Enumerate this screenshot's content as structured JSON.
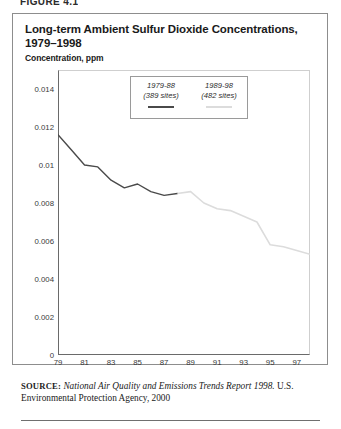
{
  "figure": {
    "caption_partial": "FIGURE 4.1",
    "title": "Long-term Ambient Sulfur Dioxide Concentrations, 1979–1998",
    "subtitle": "Concentration, ppm"
  },
  "legend": {
    "entries": [
      {
        "name": "1979-88",
        "sites": "(389 sites)",
        "color": "#4a4a4a"
      },
      {
        "name": "1989-98",
        "sites": "(482 sites)",
        "color": "#dcdcdc"
      }
    ]
  },
  "source": {
    "label": "SOURCE:",
    "italic_part": "National Air Quality and Emissions Trends Report 1998.",
    "rest": " U.S. Environmental Protection Agency, 2000"
  },
  "chart_data": {
    "type": "line",
    "title": "Long-term Ambient Sulfur Dioxide Concentrations, 1979–1998",
    "xlabel": "",
    "ylabel": "Concentration, ppm",
    "xlim": [
      1979,
      1998
    ],
    "ylim": [
      0,
      0.015
    ],
    "grid": false,
    "legend_position": "inside-top-center",
    "y_ticks": [
      0,
      0.002,
      0.004,
      0.006,
      0.008,
      0.01,
      0.012,
      0.014
    ],
    "y_tick_labels": [
      "0",
      "0.002",
      "0.004",
      "0.006",
      "0.008",
      "0.01",
      "0.012",
      "0.014"
    ],
    "x_ticks": [
      1979,
      1981,
      1983,
      1985,
      1987,
      1989,
      1991,
      1993,
      1995,
      1997
    ],
    "x_tick_labels": [
      "79",
      "81",
      "83",
      "85",
      "87",
      "89",
      "91",
      "93",
      "95",
      "97"
    ],
    "series": [
      {
        "name": "1979-88",
        "sites": 389,
        "color": "#4a4a4a",
        "x": [
          1979,
          1980,
          1981,
          1982,
          1983,
          1984,
          1985,
          1986,
          1987,
          1988
        ],
        "values": [
          0.0116,
          0.0108,
          0.01,
          0.0099,
          0.0092,
          0.0088,
          0.009,
          0.0086,
          0.0084,
          0.0085
        ]
      },
      {
        "name": "1989-98",
        "sites": 482,
        "color": "#dcdcdc",
        "x": [
          1989,
          1990,
          1991,
          1992,
          1993,
          1994,
          1995,
          1996,
          1997,
          1998
        ],
        "values": [
          0.0086,
          0.008,
          0.0077,
          0.0076,
          0.0073,
          0.007,
          0.0058,
          0.0057,
          0.0055,
          0.0053
        ]
      }
    ]
  }
}
